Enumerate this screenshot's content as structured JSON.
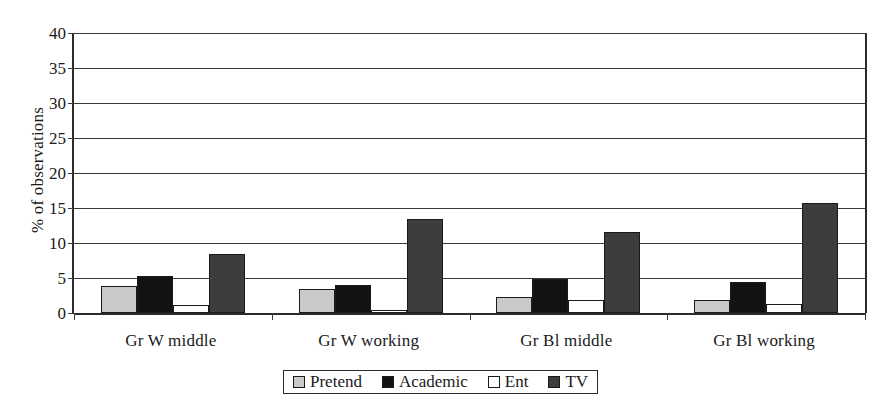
{
  "chart_data": {
    "type": "bar",
    "title": "",
    "subtitle": "",
    "xlabel": "",
    "ylabel": "% of observations",
    "ylim": [
      0,
      40
    ],
    "ytick_step": 5,
    "yticks": [
      "0",
      "5",
      "10",
      "15",
      "20",
      "25",
      "30",
      "35",
      "40"
    ],
    "grid": true,
    "legend_position": "bottom-center",
    "categories": [
      "Gr W middle",
      "Gr W working",
      "Gr Bl  middle",
      "Gr Bl working"
    ],
    "series": [
      {
        "name": "Pretend",
        "color": "#c9c9c9",
        "values": [
          3.8,
          3.5,
          2.3,
          1.9
        ]
      },
      {
        "name": "Academic",
        "color": "#121212",
        "values": [
          5.3,
          4.0,
          4.8,
          4.5
        ]
      },
      {
        "name": "Ent",
        "color": "#ffffff",
        "values": [
          1.2,
          0.5,
          1.8,
          1.3
        ]
      },
      {
        "name": "TV",
        "color": "#3d3d3d",
        "values": [
          8.5,
          13.5,
          11.6,
          15.7
        ]
      }
    ]
  },
  "legend": {
    "items": [
      {
        "label": "Pretend",
        "swatch_name": "legend-swatch-pretend"
      },
      {
        "label": "Academic",
        "swatch_name": "legend-swatch-academic"
      },
      {
        "label": "Ent",
        "swatch_name": "legend-swatch-ent"
      },
      {
        "label": "TV",
        "swatch_name": "legend-swatch-tv"
      }
    ]
  }
}
